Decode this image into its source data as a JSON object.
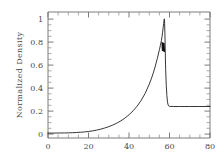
{
  "chart_data": {
    "type": "line",
    "title": "",
    "subtitle": "",
    "xlabel": "",
    "ylabel": "Normalized Density",
    "xlim": [
      0,
      80
    ],
    "ylim": [
      -0.04,
      1.06
    ],
    "grid": false,
    "legend": null,
    "x_ticks": [
      0,
      20,
      40,
      60,
      80
    ],
    "x_tick_labels": [
      "0",
      "20",
      "40",
      "60",
      "80"
    ],
    "x_minor_tick_interval": 5,
    "y_ticks": [
      0,
      0.2,
      0.4,
      0.6,
      0.8,
      1
    ],
    "y_tick_labels": [
      "0",
      "0.2",
      "0.4",
      "0.6",
      "0.8",
      "1"
    ],
    "y_minor_tick_interval": 0.05,
    "line_color": "#231f20",
    "background_color": "#ffffff",
    "axis_color": "#6d6d6d",
    "series": [
      {
        "name": "Normalized Density",
        "x": [
          0,
          2,
          4,
          6,
          8,
          10,
          12,
          14,
          16,
          18,
          20,
          22,
          24,
          26,
          28,
          30,
          32,
          34,
          36,
          38,
          40,
          42,
          44,
          46,
          48,
          50,
          51,
          52,
          53,
          54,
          55,
          55.5,
          56,
          56.3,
          56.6,
          56.9,
          57.1,
          57.3,
          57.45,
          57.6,
          57.75,
          57.9,
          58.1,
          58.4,
          58.7,
          59,
          59.3,
          59.6,
          60,
          62,
          65,
          70,
          75,
          80
        ],
        "y": [
          0.003,
          0.003,
          0.003,
          0.004,
          0.004,
          0.005,
          0.006,
          0.008,
          0.01,
          0.013,
          0.017,
          0.022,
          0.029,
          0.037,
          0.047,
          0.059,
          0.073,
          0.09,
          0.11,
          0.134,
          0.163,
          0.197,
          0.238,
          0.288,
          0.35,
          0.43,
          0.476,
          0.528,
          0.588,
          0.655,
          0.73,
          0.768,
          0.81,
          0.845,
          0.884,
          0.926,
          0.958,
          0.985,
          1.0,
          0.96,
          0.86,
          0.72,
          0.56,
          0.42,
          0.33,
          0.275,
          0.25,
          0.24,
          0.236,
          0.235,
          0.235,
          0.235,
          0.235,
          0.235
        ]
      }
    ],
    "annotations": [
      {
        "name": "peak-marker",
        "x": 56.8,
        "y": 0.755,
        "description": "thickened dark segment on rising edge of peak"
      }
    ]
  }
}
